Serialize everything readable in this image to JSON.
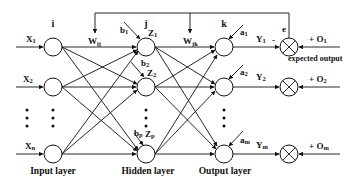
{
  "diagram": {
    "type": "neural-network-backpropagation",
    "layers": {
      "input": {
        "caption": "Input layer",
        "index_label": "i",
        "nodes": [
          {
            "label_main": "X",
            "label_sub": "1"
          },
          {
            "label_main": "X",
            "label_sub": "2"
          },
          {
            "label_main": "X",
            "label_sub": "n"
          }
        ]
      },
      "hidden": {
        "caption": "Hidden layer",
        "index_label": "j",
        "weight_label_main": "W",
        "weight_label_sub": "ij",
        "nodes": [
          {
            "label_main": "Z",
            "label_sub": "1",
            "bias_main": "b",
            "bias_sub": "1"
          },
          {
            "label_main": "Z",
            "label_sub": "2",
            "bias_main": "b",
            "bias_sub": "2"
          },
          {
            "label_main": "Z",
            "label_sub": "p",
            "bias_main": "b",
            "bias_sub": "p"
          }
        ]
      },
      "output": {
        "caption": "Output layer",
        "index_label": "k",
        "weight_label_main": "W",
        "weight_label_sub": "jk",
        "nodes": [
          {
            "label_main": "Y",
            "label_sub": "1",
            "bias_main": "a",
            "bias_sub": "1"
          },
          {
            "label_main": "Y",
            "label_sub": "2",
            "bias_main": "a",
            "bias_sub": "2"
          },
          {
            "label_main": "Y",
            "label_sub": "m",
            "bias_main": "a",
            "bias_sub": "m"
          }
        ]
      }
    },
    "comparators": [
      {
        "minus": "-",
        "target_main": "+ O",
        "target_sub": "1"
      },
      {
        "target_main": "+ O",
        "target_sub": "2"
      },
      {
        "target_main": "+ O",
        "target_sub": "m"
      }
    ],
    "error_label": "e",
    "expected_output_label": "expected output"
  }
}
